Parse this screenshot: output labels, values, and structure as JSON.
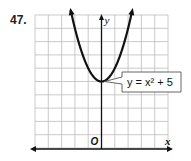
{
  "problem_number": "47.",
  "chart_data": {
    "type": "line",
    "title": "",
    "function_label": "y = x² + 5",
    "equation": "y = x^2 + 5",
    "xlabel": "x",
    "ylabel": "y",
    "origin_label": "O",
    "xlim": [
      -5,
      5
    ],
    "ylim": [
      0,
      10
    ],
    "grid": true,
    "x": [
      -2.3,
      -2,
      -1.5,
      -1,
      -0.5,
      0,
      0.5,
      1,
      1.5,
      2,
      2.3
    ],
    "values": [
      10.29,
      9,
      7.25,
      6,
      5.25,
      5,
      5.25,
      6,
      7.25,
      9,
      10.29
    ],
    "vertex": [
      0,
      5
    ],
    "arrows": "both ends of curve and left/right of x-axis, top of y-axis"
  },
  "colors": {
    "grid": "#bdbdbd",
    "curve": "#111111",
    "axis": "#111111"
  }
}
